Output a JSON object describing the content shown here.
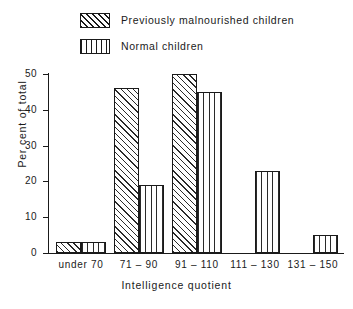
{
  "legend": {
    "position": "top-left",
    "items": [
      {
        "label": "Previously  malnourished  children",
        "pattern": "diagonal-hatch",
        "swatch_icon": "hatched-swatch-icon"
      },
      {
        "label": "Normal  children",
        "pattern": "vertical-stripe",
        "swatch_icon": "striped-swatch-icon"
      }
    ]
  },
  "axes": {
    "y_title": "Per cent of total",
    "x_title": "Intelligence quotient",
    "y_ticks": [
      "0",
      "10",
      "20",
      "30",
      "40",
      "50"
    ]
  },
  "chart_data": {
    "type": "bar",
    "title": "",
    "subtitle": "",
    "xlabel": "Intelligence quotient",
    "ylabel": "Per cent of total",
    "categories": [
      "under 70",
      "71 – 90",
      "91 – 110",
      "111 – 130",
      "131 – 150"
    ],
    "series": [
      {
        "name": "Previously  malnourished  children",
        "values": [
          3,
          46,
          50,
          0,
          0
        ],
        "pattern": "diagonal-hatch"
      },
      {
        "name": "Normal  children",
        "values": [
          3,
          19,
          45,
          23,
          5
        ],
        "pattern": "vertical-stripe"
      }
    ],
    "ylim": [
      0,
      50
    ],
    "ytick_step": 10,
    "grid": false,
    "legend_position": "top-left"
  }
}
